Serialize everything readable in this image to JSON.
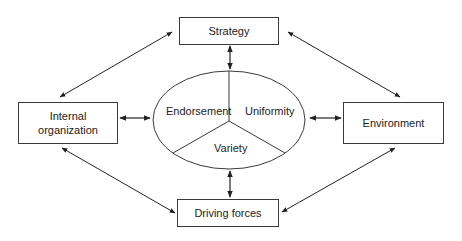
{
  "diagram": {
    "type": "relationship-diagram",
    "center": {
      "shape": "ellipse",
      "segments": [
        {
          "id": "endorsement",
          "label": "Endorsement"
        },
        {
          "id": "uniformity",
          "label": "Uniformity"
        },
        {
          "id": "variety",
          "label": "Variety"
        }
      ]
    },
    "nodes": [
      {
        "id": "strategy",
        "label": "Strategy",
        "position": "top"
      },
      {
        "id": "internal",
        "label": "Internal organization",
        "label_lines": [
          "Internal",
          "organization"
        ],
        "position": "left"
      },
      {
        "id": "environment",
        "label": "Environment",
        "position": "right"
      },
      {
        "id": "driving",
        "label": "Driving forces",
        "position": "bottom"
      }
    ],
    "edges": [
      {
        "from": "strategy",
        "to": "center",
        "bidirectional": true
      },
      {
        "from": "internal",
        "to": "center",
        "bidirectional": true
      },
      {
        "from": "environment",
        "to": "center",
        "bidirectional": true
      },
      {
        "from": "driving",
        "to": "center",
        "bidirectional": true
      },
      {
        "from": "strategy",
        "to": "internal",
        "bidirectional": true
      },
      {
        "from": "strategy",
        "to": "environment",
        "bidirectional": true
      },
      {
        "from": "internal",
        "to": "driving",
        "bidirectional": true
      },
      {
        "from": "environment",
        "to": "driving",
        "bidirectional": true
      }
    ],
    "colors": {
      "stroke": "#3a3a3a",
      "text": "#222222",
      "background": "#ffffff"
    }
  }
}
